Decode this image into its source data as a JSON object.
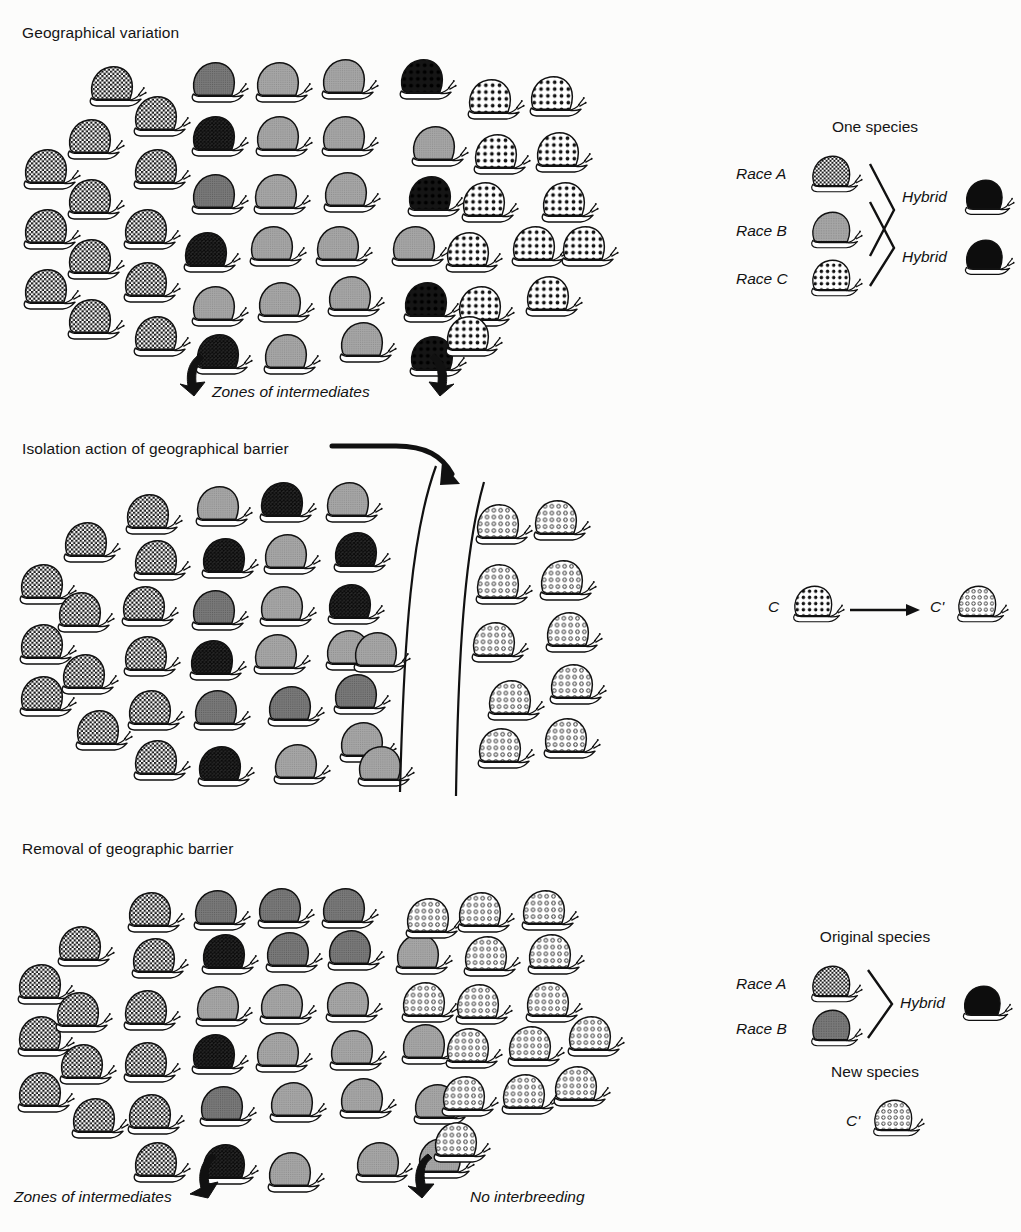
{
  "figure": {
    "background_color": "#fcfcfb",
    "ink_color": "#111111"
  },
  "panels": [
    {
      "id": "geographical-variation",
      "title": "Geographical variation",
      "caption": "Zones of intermediates",
      "arrow_count": 2
    },
    {
      "id": "isolation",
      "title": "Isolation action of geographical barrier",
      "barrier": "two-curved-lines",
      "has_pointer_arrow": true
    },
    {
      "id": "removal",
      "title": "Removal of geographic barrier",
      "caption_left": "Zones of intermediates",
      "caption_right": "No interbreeding"
    }
  ],
  "legends": [
    {
      "id": "one-species",
      "title": "One species",
      "rows": [
        {
          "label": "Race A",
          "pattern": "checker"
        },
        {
          "label": "Race B",
          "pattern": "gray"
        },
        {
          "label": "Race C",
          "pattern": "dots"
        }
      ],
      "results": [
        {
          "label": "Hybrid",
          "pattern": "black"
        },
        {
          "label": "Hybrid",
          "pattern": "black"
        }
      ]
    },
    {
      "id": "isolation-change",
      "from_label": "C",
      "from_pattern": "dots",
      "to_label": "C'",
      "to_pattern": "rings",
      "arrow": "right-arrow"
    },
    {
      "id": "original-species",
      "title": "Original species",
      "rows": [
        {
          "label": "Race A",
          "pattern": "checker"
        },
        {
          "label": "Race B",
          "pattern": "gray"
        }
      ],
      "results": [
        {
          "label": "Hybrid",
          "pattern": "black"
        }
      ]
    },
    {
      "id": "new-species",
      "title": "New species",
      "label": "C'",
      "pattern": "rings"
    }
  ],
  "patterns": {
    "checker": {
      "name": "checkered",
      "fill": "#ffffff",
      "mark": "#1a1a1a"
    },
    "gray": {
      "name": "solid-gray",
      "fill": "#9a9a9a",
      "mark": "#9a9a9a"
    },
    "gray_dark": {
      "name": "dark-gray",
      "fill": "#6e6e6e",
      "mark": "#6e6e6e"
    },
    "dark": {
      "name": "dark-crosshatch",
      "fill": "#2a2a2a",
      "mark": "#101010"
    },
    "black": {
      "name": "solid-black",
      "fill": "#0d0d0d",
      "mark": "#0d0d0d"
    },
    "dots": {
      "name": "black-polka-dots",
      "fill": "#ffffff",
      "mark": "#111111"
    },
    "rings": {
      "name": "open-rings",
      "fill": "#ffffff",
      "mark": "#111111"
    },
    "blackdots": {
      "name": "dots-on-black",
      "fill": "#141414",
      "mark": "#141414"
    }
  },
  "populations": {
    "panel1": [
      {
        "x": 18,
        "y": 145,
        "p": "checker"
      },
      {
        "x": 18,
        "y": 205,
        "p": "checker"
      },
      {
        "x": 18,
        "y": 265,
        "p": "checker"
      },
      {
        "x": 62,
        "y": 115,
        "p": "checker"
      },
      {
        "x": 62,
        "y": 175,
        "p": "checker"
      },
      {
        "x": 62,
        "y": 235,
        "p": "checker"
      },
      {
        "x": 62,
        "y": 295,
        "p": "checker"
      },
      {
        "x": 84,
        "y": 62,
        "p": "checker"
      },
      {
        "x": 128,
        "y": 92,
        "p": "checker"
      },
      {
        "x": 128,
        "y": 145,
        "p": "checker"
      },
      {
        "x": 118,
        "y": 205,
        "p": "checker"
      },
      {
        "x": 118,
        "y": 258,
        "p": "checker"
      },
      {
        "x": 128,
        "y": 312,
        "p": "checker"
      },
      {
        "x": 186,
        "y": 58,
        "p": "gray_dark"
      },
      {
        "x": 186,
        "y": 112,
        "p": "dark"
      },
      {
        "x": 186,
        "y": 170,
        "p": "gray_dark"
      },
      {
        "x": 178,
        "y": 228,
        "p": "dark"
      },
      {
        "x": 186,
        "y": 282,
        "p": "gray"
      },
      {
        "x": 190,
        "y": 330,
        "p": "dark"
      },
      {
        "x": 250,
        "y": 58,
        "p": "gray"
      },
      {
        "x": 250,
        "y": 112,
        "p": "gray"
      },
      {
        "x": 248,
        "y": 170,
        "p": "gray"
      },
      {
        "x": 244,
        "y": 222,
        "p": "gray"
      },
      {
        "x": 252,
        "y": 278,
        "p": "gray"
      },
      {
        "x": 258,
        "y": 330,
        "p": "gray"
      },
      {
        "x": 316,
        "y": 55,
        "p": "gray"
      },
      {
        "x": 316,
        "y": 112,
        "p": "gray"
      },
      {
        "x": 318,
        "y": 168,
        "p": "gray"
      },
      {
        "x": 310,
        "y": 222,
        "p": "gray"
      },
      {
        "x": 322,
        "y": 272,
        "p": "gray"
      },
      {
        "x": 334,
        "y": 318,
        "p": "gray"
      },
      {
        "x": 394,
        "y": 55,
        "p": "blackdots"
      },
      {
        "x": 406,
        "y": 122,
        "p": "gray"
      },
      {
        "x": 402,
        "y": 172,
        "p": "blackdots"
      },
      {
        "x": 386,
        "y": 222,
        "p": "gray"
      },
      {
        "x": 398,
        "y": 278,
        "p": "blackdots"
      },
      {
        "x": 404,
        "y": 332,
        "p": "blackdots"
      },
      {
        "x": 462,
        "y": 75,
        "p": "dots"
      },
      {
        "x": 468,
        "y": 130,
        "p": "dots"
      },
      {
        "x": 456,
        "y": 178,
        "p": "dots"
      },
      {
        "x": 440,
        "y": 228,
        "p": "dots"
      },
      {
        "x": 452,
        "y": 282,
        "p": "dots"
      },
      {
        "x": 440,
        "y": 312,
        "p": "dots"
      },
      {
        "x": 524,
        "y": 72,
        "p": "dots"
      },
      {
        "x": 530,
        "y": 128,
        "p": "dots"
      },
      {
        "x": 536,
        "y": 178,
        "p": "dots"
      },
      {
        "x": 506,
        "y": 222,
        "p": "dots"
      },
      {
        "x": 520,
        "y": 272,
        "p": "dots"
      },
      {
        "x": 556,
        "y": 222,
        "p": "dots"
      }
    ],
    "panel2_left": [
      {
        "x": 14,
        "y": 560,
        "p": "checker"
      },
      {
        "x": 14,
        "y": 620,
        "p": "checker"
      },
      {
        "x": 14,
        "y": 672,
        "p": "checker"
      },
      {
        "x": 58,
        "y": 518,
        "p": "checker"
      },
      {
        "x": 52,
        "y": 588,
        "p": "checker"
      },
      {
        "x": 56,
        "y": 650,
        "p": "checker"
      },
      {
        "x": 70,
        "y": 706,
        "p": "checker"
      },
      {
        "x": 120,
        "y": 490,
        "p": "checker"
      },
      {
        "x": 128,
        "y": 536,
        "p": "checker"
      },
      {
        "x": 116,
        "y": 582,
        "p": "checker"
      },
      {
        "x": 118,
        "y": 632,
        "p": "checker"
      },
      {
        "x": 122,
        "y": 686,
        "p": "checker"
      },
      {
        "x": 128,
        "y": 736,
        "p": "checker"
      },
      {
        "x": 190,
        "y": 482,
        "p": "gray"
      },
      {
        "x": 196,
        "y": 534,
        "p": "dark"
      },
      {
        "x": 186,
        "y": 586,
        "p": "gray_dark"
      },
      {
        "x": 184,
        "y": 636,
        "p": "dark"
      },
      {
        "x": 188,
        "y": 686,
        "p": "gray_dark"
      },
      {
        "x": 192,
        "y": 742,
        "p": "dark"
      },
      {
        "x": 254,
        "y": 478,
        "p": "dark"
      },
      {
        "x": 258,
        "y": 530,
        "p": "gray"
      },
      {
        "x": 254,
        "y": 582,
        "p": "gray"
      },
      {
        "x": 248,
        "y": 630,
        "p": "gray"
      },
      {
        "x": 262,
        "y": 682,
        "p": "gray_dark"
      },
      {
        "x": 268,
        "y": 740,
        "p": "gray"
      },
      {
        "x": 320,
        "y": 478,
        "p": "gray"
      },
      {
        "x": 328,
        "y": 528,
        "p": "dark"
      },
      {
        "x": 322,
        "y": 580,
        "p": "dark"
      },
      {
        "x": 320,
        "y": 626,
        "p": "gray"
      },
      {
        "x": 328,
        "y": 670,
        "p": "gray_dark"
      },
      {
        "x": 334,
        "y": 718,
        "p": "gray"
      },
      {
        "x": 348,
        "y": 628,
        "p": "gray"
      },
      {
        "x": 352,
        "y": 742,
        "p": "gray"
      }
    ],
    "panel2_right": [
      {
        "x": 470,
        "y": 500,
        "p": "rings"
      },
      {
        "x": 470,
        "y": 560,
        "p": "rings"
      },
      {
        "x": 466,
        "y": 618,
        "p": "rings"
      },
      {
        "x": 482,
        "y": 676,
        "p": "rings"
      },
      {
        "x": 472,
        "y": 724,
        "p": "rings"
      },
      {
        "x": 528,
        "y": 496,
        "p": "rings"
      },
      {
        "x": 534,
        "y": 556,
        "p": "rings"
      },
      {
        "x": 540,
        "y": 608,
        "p": "rings"
      },
      {
        "x": 544,
        "y": 660,
        "p": "rings"
      },
      {
        "x": 538,
        "y": 714,
        "p": "rings"
      }
    ],
    "panel3": [
      {
        "x": 12,
        "y": 960,
        "p": "checker"
      },
      {
        "x": 12,
        "y": 1012,
        "p": "checker"
      },
      {
        "x": 12,
        "y": 1068,
        "p": "checker"
      },
      {
        "x": 52,
        "y": 922,
        "p": "checker"
      },
      {
        "x": 50,
        "y": 988,
        "p": "checker"
      },
      {
        "x": 54,
        "y": 1040,
        "p": "checker"
      },
      {
        "x": 66,
        "y": 1094,
        "p": "checker"
      },
      {
        "x": 122,
        "y": 888,
        "p": "checker"
      },
      {
        "x": 126,
        "y": 934,
        "p": "checker"
      },
      {
        "x": 118,
        "y": 986,
        "p": "checker"
      },
      {
        "x": 118,
        "y": 1038,
        "p": "checker"
      },
      {
        "x": 122,
        "y": 1090,
        "p": "checker"
      },
      {
        "x": 128,
        "y": 1138,
        "p": "checker"
      },
      {
        "x": 188,
        "y": 886,
        "p": "gray_dark"
      },
      {
        "x": 196,
        "y": 930,
        "p": "dark"
      },
      {
        "x": 190,
        "y": 982,
        "p": "gray"
      },
      {
        "x": 186,
        "y": 1030,
        "p": "dark"
      },
      {
        "x": 194,
        "y": 1082,
        "p": "gray_dark"
      },
      {
        "x": 196,
        "y": 1140,
        "p": "dark"
      },
      {
        "x": 252,
        "y": 884,
        "p": "gray_dark"
      },
      {
        "x": 260,
        "y": 928,
        "p": "gray_dark"
      },
      {
        "x": 254,
        "y": 980,
        "p": "gray"
      },
      {
        "x": 250,
        "y": 1028,
        "p": "gray"
      },
      {
        "x": 264,
        "y": 1078,
        "p": "gray"
      },
      {
        "x": 262,
        "y": 1148,
        "p": "gray"
      },
      {
        "x": 316,
        "y": 884,
        "p": "gray_dark"
      },
      {
        "x": 322,
        "y": 926,
        "p": "gray_dark"
      },
      {
        "x": 320,
        "y": 978,
        "p": "gray"
      },
      {
        "x": 324,
        "y": 1026,
        "p": "gray"
      },
      {
        "x": 334,
        "y": 1074,
        "p": "gray"
      },
      {
        "x": 350,
        "y": 1138,
        "p": "gray"
      },
      {
        "x": 390,
        "y": 930,
        "p": "gray"
      },
      {
        "x": 396,
        "y": 1020,
        "p": "gray"
      },
      {
        "x": 408,
        "y": 1080,
        "p": "gray"
      },
      {
        "x": 412,
        "y": 1134,
        "p": "gray"
      },
      {
        "x": 400,
        "y": 894,
        "p": "rings"
      },
      {
        "x": 396,
        "y": 978,
        "p": "rings"
      },
      {
        "x": 452,
        "y": 888,
        "p": "rings"
      },
      {
        "x": 458,
        "y": 932,
        "p": "rings"
      },
      {
        "x": 450,
        "y": 980,
        "p": "rings"
      },
      {
        "x": 440,
        "y": 1024,
        "p": "rings"
      },
      {
        "x": 436,
        "y": 1072,
        "p": "rings"
      },
      {
        "x": 428,
        "y": 1118,
        "p": "rings"
      },
      {
        "x": 516,
        "y": 886,
        "p": "rings"
      },
      {
        "x": 522,
        "y": 930,
        "p": "rings"
      },
      {
        "x": 520,
        "y": 978,
        "p": "rings"
      },
      {
        "x": 502,
        "y": 1022,
        "p": "rings"
      },
      {
        "x": 496,
        "y": 1070,
        "p": "rings"
      },
      {
        "x": 562,
        "y": 1012,
        "p": "rings"
      },
      {
        "x": 548,
        "y": 1062,
        "p": "rings"
      }
    ]
  },
  "positions": {
    "panel1_title": {
      "x": 22,
      "y": 24
    },
    "panel1_caption": {
      "x": 212,
      "y": 383
    },
    "panel1_arrow_left": {
      "x": 178,
      "y": 352
    },
    "panel1_arrow_right": {
      "x": 418,
      "y": 352
    },
    "panel2_title": {
      "x": 22,
      "y": 440
    },
    "panel3_title": {
      "x": 22,
      "y": 840
    },
    "panel3_caption_left": {
      "x": 14,
      "y": 1188
    },
    "panel3_caption_right": {
      "x": 470,
      "y": 1188
    },
    "panel3_arrow_left": {
      "x": 186,
      "y": 1152
    },
    "panel3_arrow_right": {
      "x": 408,
      "y": 1152
    },
    "legend1": {
      "x": 735,
      "y": 120
    },
    "legend2": {
      "x": 768,
      "y": 588
    },
    "legend3": {
      "x": 735,
      "y": 930
    },
    "legend4": {
      "x": 800,
      "y": 1065
    }
  }
}
